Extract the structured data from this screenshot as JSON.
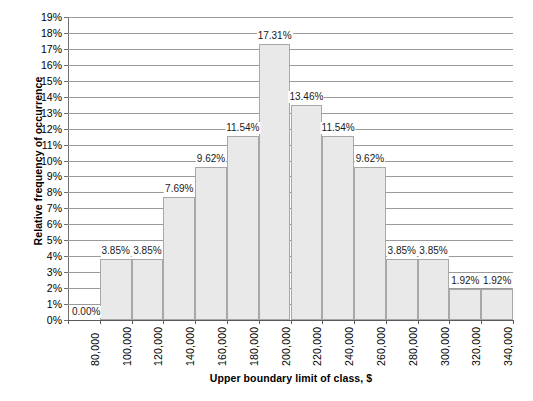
{
  "chart_data": {
    "type": "bar",
    "title": "",
    "xlabel": "Upper boundary limit of class, $",
    "ylabel": "Relative frequency of occurrence",
    "categories": [
      "80,000",
      "100,000",
      "120,000",
      "140,000",
      "160,000",
      "180,000",
      "200,000",
      "220,000",
      "240,000",
      "260,000",
      "280,000",
      "300,000",
      "320,000",
      "340,000"
    ],
    "values": [
      0.0,
      3.85,
      3.85,
      7.69,
      9.62,
      11.54,
      17.31,
      13.46,
      11.54,
      9.62,
      3.85,
      3.85,
      1.92,
      1.92
    ],
    "data_labels": [
      "0.00%",
      "3.85%",
      "3.85%",
      "7.69%",
      "9.62%",
      "11.54%",
      "17.31%",
      "13.46%",
      "11.54%",
      "9.62%",
      "3.85%",
      "3.85%",
      "1.92%",
      "1.92%"
    ],
    "ylim": [
      0,
      19
    ],
    "ytick_step": 1,
    "ytick_labels": [
      "0%",
      "1%",
      "2%",
      "3%",
      "4%",
      "5%",
      "6%",
      "7%",
      "8%",
      "9%",
      "10%",
      "11%",
      "12%",
      "13%",
      "14%",
      "15%",
      "16%",
      "17%",
      "18%",
      "19%"
    ],
    "grid": true,
    "grid_axis": "y",
    "legend": "none",
    "bar_fill_color": "#e9e9e9",
    "bar_border_color": "#a8a8a8",
    "gridline_color": "#9a9a9a",
    "axis_color": "#5a5a5a",
    "bars_contiguous": true
  },
  "axes": {
    "y_title": "Relative frequency of occurrence",
    "x_title": "Upper boundary limit of class, $"
  }
}
